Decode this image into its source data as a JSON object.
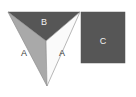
{
  "figure": {
    "background_color": "#ffffff",
    "border_color": "#e6e6e6",
    "labels": {
      "left_triangle": "A",
      "right_triangle": "A",
      "top_triangle": "B",
      "rectangle": "C"
    },
    "colors": {
      "light_gray": "#a9a9a9",
      "white_fill": "#fafafa",
      "dark_gray": "#565656",
      "outline": "#8c8c8c",
      "label_on_dark": "#f2f2f2",
      "label_on_light": "#3a3a3a"
    },
    "regions": [
      {
        "name": "left-triangle-a",
        "label": "A",
        "fill": "#a9a9a9",
        "shape": "triangle",
        "points": "8,12 46,41 47,86",
        "label_x": 24,
        "label_y": 56
      },
      {
        "name": "right-triangle-a",
        "label": "A",
        "fill": "#fafafa",
        "shape": "triangle",
        "points": "46,41 80,12 47,86",
        "label_x": 62,
        "label_y": 56
      },
      {
        "name": "top-triangle-b",
        "label": "B",
        "fill": "#565656",
        "shape": "triangle",
        "points": "8,12 80,12 46,41",
        "label_x": 44,
        "label_y": 25
      },
      {
        "name": "rectangle-c",
        "label": "C",
        "fill": "#565656",
        "shape": "rectangle",
        "x": 81,
        "y": 12,
        "width": 44,
        "height": 51,
        "label_x": 103,
        "label_y": 41
      }
    ]
  }
}
